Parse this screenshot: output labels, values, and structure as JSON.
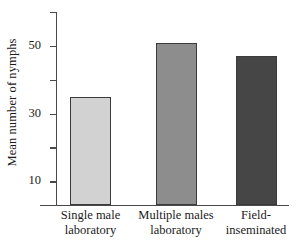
{
  "chart_data": {
    "type": "bar",
    "title": "",
    "subtitle": "",
    "xlabel": "",
    "ylabel": "Mean number of nymphs",
    "categories": [
      "Single male laboratory",
      "Multiple males laboratory",
      "Field-inseminated"
    ],
    "category_lines": [
      [
        "Single male",
        "laboratory"
      ],
      [
        "Multiple males",
        "laboratory"
      ],
      [
        "Field-",
        "inseminated"
      ]
    ],
    "values": [
      35,
      51,
      47
    ],
    "ylim": [
      3,
      60
    ],
    "yticks": [
      10,
      20,
      30,
      40,
      50,
      60
    ],
    "ytick_labels": [
      "10",
      "",
      "30",
      "",
      "50",
      ""
    ],
    "grid": false,
    "legend": false,
    "bar_colors": [
      "#d2d2d2",
      "#8d8d8d",
      "#464646"
    ],
    "bar_edge_color": "#3b3b3b",
    "axis_color": "#4a4a4a",
    "background": "#ffffff"
  },
  "axis": {
    "y_title": "Mean number of nymphs",
    "ticks": [
      {
        "value": 60,
        "label": ""
      },
      {
        "value": 50,
        "label": "50"
      },
      {
        "value": 40,
        "label": ""
      },
      {
        "value": 30,
        "label": "30"
      },
      {
        "value": 20,
        "label": ""
      },
      {
        "value": 10,
        "label": "10"
      }
    ]
  },
  "bars": [
    {
      "label_line1": "Single male",
      "label_line2": "laboratory",
      "value": 35,
      "color": "#d2d2d2"
    },
    {
      "label_line1": "Multiple males",
      "label_line2": "laboratory",
      "value": 51,
      "color": "#8d8d8d"
    },
    {
      "label_line1": "Field-",
      "label_line2": "inseminated",
      "value": 47,
      "color": "#464646"
    }
  ]
}
